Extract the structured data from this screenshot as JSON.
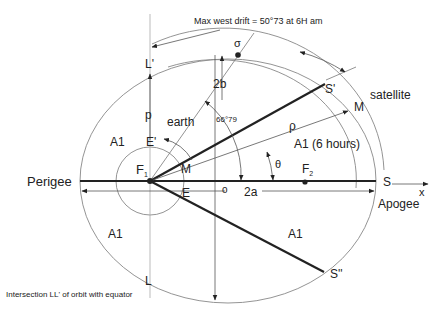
{
  "diagram": {
    "title_note": "Max west drift = 50°73 at 6H am",
    "caption": "Intersection LL' of orbit with equator",
    "labels": {
      "perigee": "Perigee",
      "apogee": "Apogee",
      "satellite": "satellite",
      "earth": "earth",
      "F1": "F",
      "F1_sub": "1",
      "F2": "F",
      "F2_sub": "2",
      "S": "S",
      "S_prime": "S'",
      "S_double_prime": "S''",
      "M_inner": "M",
      "M_outer": "M",
      "E": "E",
      "E_prime": "E'",
      "L": "L",
      "L_prime": "L'",
      "p": "p",
      "rho": "ρ",
      "theta": "θ",
      "sigma": "σ",
      "two_a": "2a",
      "two_b": "2b",
      "o": "o",
      "x": "x",
      "angle": "66°79",
      "A1_top_left": "A1",
      "A1_top_right": "A1 (6 hours)",
      "A1_bottom_left": "A1",
      "A1_bottom_right": "A1"
    },
    "colors": {
      "line": "#222222",
      "thin_line": "#777777",
      "background": "#ffffff"
    }
  }
}
